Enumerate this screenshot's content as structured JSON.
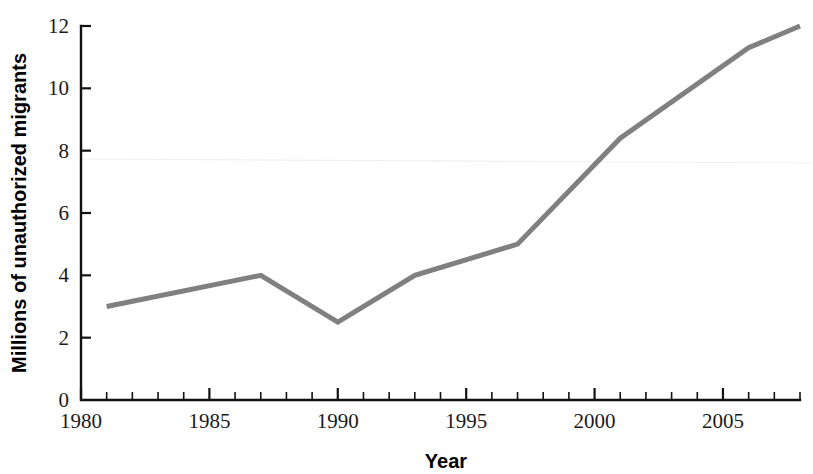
{
  "chart_data": {
    "type": "line",
    "title": "",
    "xlabel": "Year",
    "ylabel": "Millions of unauthorized migrants",
    "xlim": [
      1980,
      2008
    ],
    "ylim": [
      0,
      12
    ],
    "grid": false,
    "legend": null,
    "x_tick_labels": [
      "1980",
      "1985",
      "1990",
      "1995",
      "2000",
      "2005"
    ],
    "x_tick_values": [
      1980,
      1985,
      1990,
      1995,
      2000,
      2005
    ],
    "x_minor_step": 1,
    "y_tick_labels": [
      "0",
      "2",
      "4",
      "6",
      "8",
      "10",
      "12"
    ],
    "y_tick_values": [
      0,
      2,
      4,
      6,
      8,
      10,
      12
    ],
    "series": [
      {
        "name": "Unauthorized migrants",
        "color": "#808080",
        "x": [
          1981,
          1987,
          1990,
          1993,
          1997,
          2001,
          2006,
          2008
        ],
        "values": [
          3.0,
          4.0,
          2.5,
          4.0,
          5.0,
          8.4,
          11.3,
          12.0
        ]
      }
    ]
  },
  "axes": {
    "y_axis_name": "y-axis",
    "x_axis_name": "x-axis"
  },
  "colors": {
    "line": "#808080",
    "axis": "#111111",
    "text": "#1a1a1a",
    "background": "#ffffff"
  }
}
